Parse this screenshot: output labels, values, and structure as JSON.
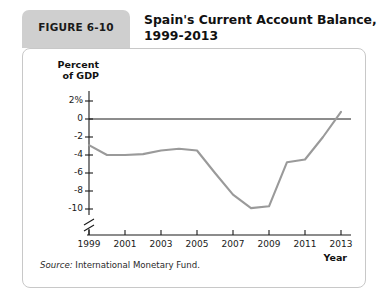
{
  "figure": {
    "badge_label": "FIGURE 6-10",
    "title_line1": "Spain's Current Account Balance,",
    "title_line2": "1999-2013",
    "source_label": "Source:",
    "source_text": "International Monetary Fund."
  },
  "colors": {
    "badge_bg": "#cfcfcf",
    "panel_border": "#c8c8c8",
    "line": "#9a9a9a",
    "axis": "#1a1a1a",
    "zero_line": "#1a1a1a"
  },
  "chart_data": {
    "type": "line",
    "title": "Spain's Current Account Balance, 1999-2013",
    "xlabel": "Year",
    "ylabel": "Percent of GDP",
    "x": [
      1999,
      2000,
      2001,
      2002,
      2003,
      2004,
      2005,
      2006,
      2007,
      2008,
      2009,
      2010,
      2011,
      2012,
      2013
    ],
    "values": [
      -2.9,
      -4.0,
      -4.0,
      -3.9,
      -3.5,
      -3.3,
      -3.5,
      -6.0,
      -8.4,
      -9.9,
      -9.7,
      -4.8,
      -4.5,
      -2.0,
      0.8
    ],
    "series": [
      {
        "name": "Current account balance (% of GDP)",
        "values": [
          -2.9,
          -4.0,
          -4.0,
          -3.9,
          -3.5,
          -3.3,
          -3.5,
          -6.0,
          -8.4,
          -9.9,
          -9.7,
          -4.8,
          -4.5,
          -2.0,
          0.8
        ]
      }
    ],
    "xlim": [
      1999,
      2013
    ],
    "ylim": [
      -10,
      2
    ],
    "y_ticks": [
      2,
      0,
      -2,
      -4,
      -6,
      -8,
      -10
    ],
    "y_tick_labels": [
      "2%",
      "0",
      "-2",
      "-4",
      "-6",
      "-8",
      "-10"
    ],
    "x_ticks": [
      1999,
      2001,
      2003,
      2005,
      2007,
      2009,
      2011,
      2013
    ],
    "x_tick_labels": [
      "1999",
      "2001",
      "2003",
      "2005",
      "2007",
      "2009",
      "2011",
      "2013"
    ],
    "grid": false,
    "legend": false,
    "axis_break": true,
    "zero_reference_line": true
  }
}
